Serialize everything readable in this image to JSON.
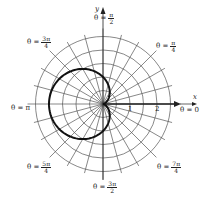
{
  "chart_data": {
    "type": "line",
    "title": "",
    "equation": "r = 1 - cos(theta)",
    "coordinate_system": "polar",
    "radial_grid": [
      0.5,
      1,
      1.5,
      2,
      2.5
    ],
    "angular_grid_step_deg": 15,
    "radial_tick_labels": [
      "1",
      "2"
    ],
    "xlabel": "x",
    "ylabel": "y",
    "angle_labels": [
      {
        "id": "zero",
        "text": "θ = 0"
      },
      {
        "id": "pi4",
        "prefix": "θ =",
        "num": "π",
        "den": "4"
      },
      {
        "id": "pi2",
        "prefix": "θ =",
        "num": "π",
        "den": "2"
      },
      {
        "id": "3pi4",
        "prefix": "θ =",
        "num": "3π",
        "den": "4"
      },
      {
        "id": "pi",
        "text": "θ = π"
      },
      {
        "id": "5pi4",
        "prefix": "θ =",
        "num": "5π",
        "den": "4"
      },
      {
        "id": "3pi2",
        "prefix": "θ =",
        "num": "3π",
        "den": "2"
      },
      {
        "id": "7pi4",
        "prefix": "θ =",
        "num": "7π",
        "den": "4"
      }
    ],
    "series": [
      {
        "name": "cardioid",
        "theta_deg": [
          0,
          45,
          90,
          135,
          180,
          225,
          270,
          315,
          360
        ],
        "r": [
          0,
          0.29,
          1,
          1.71,
          2,
          1.71,
          1,
          0.29,
          0
        ]
      }
    ]
  },
  "labels": {
    "x_axis": "x",
    "y_axis": "y",
    "tick1": "1",
    "tick2": "2",
    "theta0": "θ = 0",
    "thetaPi": "θ = π",
    "prefix": "θ =",
    "pi4": {
      "num": "π",
      "den": "4"
    },
    "pi2": {
      "num": "π",
      "den": "2"
    },
    "threePi4": {
      "num": "3π",
      "den": "4"
    },
    "fivePi4": {
      "num": "5π",
      "den": "4"
    },
    "threePi2": {
      "num": "3π",
      "den": "2"
    },
    "sevenPi4": {
      "num": "7π",
      "den": "4"
    }
  },
  "style": {
    "grid_color": "#555555",
    "curve_color": "#111111",
    "axis_color": "#222222"
  }
}
